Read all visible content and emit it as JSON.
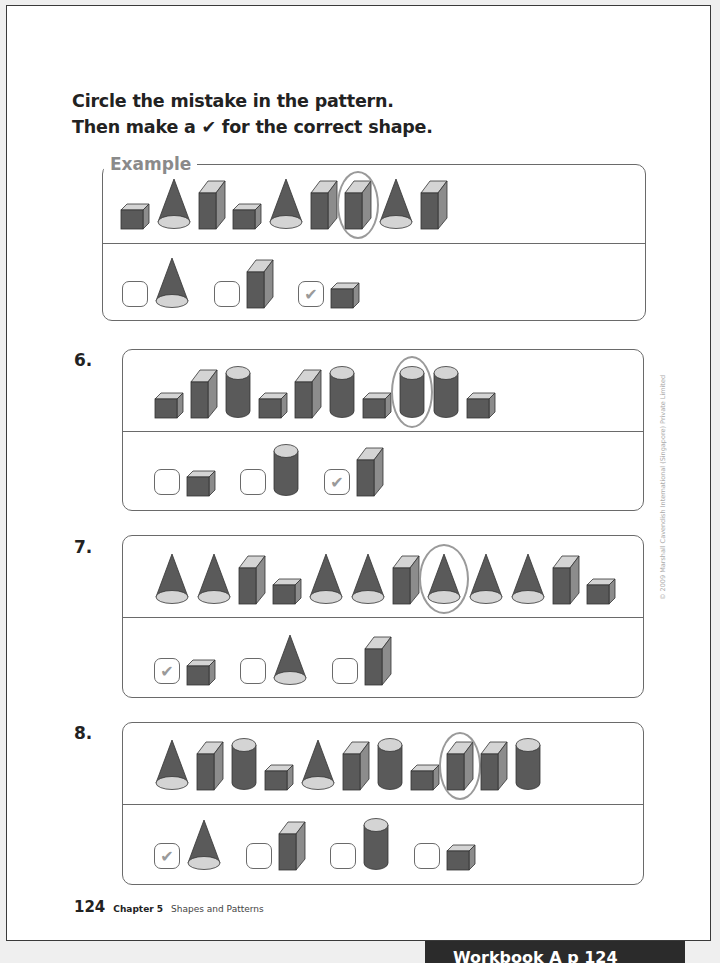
{
  "instructions": {
    "line1": "Circle the mistake in the pattern.",
    "line2_pre": "Then make a ",
    "line2_check": "✔",
    "line2_post": " for the correct shape."
  },
  "example": {
    "label": "Example",
    "pattern": [
      "cube",
      "cone",
      "prism",
      "cube",
      "cone",
      "prism",
      "prism",
      "cone",
      "prism"
    ],
    "circled_index": 6,
    "options": [
      {
        "shape": "cone",
        "checked": false
      },
      {
        "shape": "prism",
        "checked": false
      },
      {
        "shape": "cube",
        "checked": true
      }
    ]
  },
  "questions": [
    {
      "number": "6.",
      "pattern": [
        "cube",
        "prism",
        "cylinder",
        "cube",
        "prism",
        "cylinder",
        "cube",
        "cylinder",
        "cylinder",
        "cube"
      ],
      "circled_index": 7,
      "options": [
        {
          "shape": "cube",
          "checked": false
        },
        {
          "shape": "cylinder",
          "checked": false
        },
        {
          "shape": "prism",
          "checked": true
        }
      ]
    },
    {
      "number": "7.",
      "pattern": [
        "cone",
        "cone",
        "prism",
        "cube",
        "cone",
        "cone",
        "prism",
        "cone",
        "cone",
        "cone",
        "prism",
        "cube"
      ],
      "circled_index": 7,
      "options": [
        {
          "shape": "cube",
          "checked": true
        },
        {
          "shape": "cone",
          "checked": false
        },
        {
          "shape": "prism",
          "checked": false
        }
      ]
    },
    {
      "number": "8.",
      "pattern": [
        "cone",
        "prism",
        "cylinder",
        "cube",
        "cone",
        "prism",
        "cylinder",
        "cube",
        "prism",
        "prism",
        "cylinder"
      ],
      "circled_index": 8,
      "options": [
        {
          "shape": "cone",
          "checked": true
        },
        {
          "shape": "prism",
          "checked": false
        },
        {
          "shape": "cylinder",
          "checked": false
        },
        {
          "shape": "cube",
          "checked": false
        }
      ]
    }
  ],
  "check_mark": "✔",
  "copyright": "© 2009 Marshall Cavendish International (Singapore) Private Limited",
  "footer": {
    "page_number": "124",
    "chapter": "Chapter 5",
    "chapter_title": "Shapes and Patterns"
  },
  "tab_label": "Workbook A p 124",
  "colors": {
    "shape_dark": "#5a5a5a",
    "shape_side": "#8c8c8c",
    "shape_top": "#d4d4d4",
    "circle": "#9a9a9a",
    "border": "#6a6a6a"
  }
}
